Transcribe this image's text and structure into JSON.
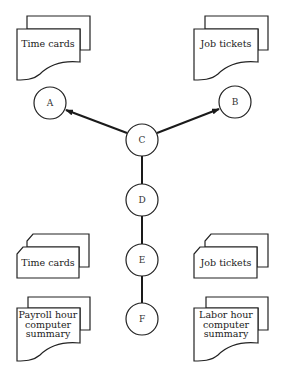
{
  "diagram": {
    "nodes": [
      {
        "id": "A",
        "label": "A"
      },
      {
        "id": "B",
        "label": "B"
      },
      {
        "id": "C",
        "label": "C"
      },
      {
        "id": "D",
        "label": "D"
      },
      {
        "id": "E",
        "label": "E"
      },
      {
        "id": "F",
        "label": "F"
      }
    ],
    "edges": [
      {
        "from": "C",
        "to": "A",
        "arrow": true
      },
      {
        "from": "C",
        "to": "B",
        "arrow": true
      },
      {
        "from": "C",
        "to": "D",
        "arrow": false
      },
      {
        "from": "D",
        "to": "E",
        "arrow": false
      },
      {
        "from": "E",
        "to": "F",
        "arrow": false
      }
    ],
    "documents": {
      "top_left": {
        "label": "Time cards"
      },
      "top_right": {
        "label": "Job tickets"
      },
      "bottom_left_summary": {
        "lines": [
          "Payroll hour",
          "computer",
          "summary"
        ]
      },
      "bottom_right_summary": {
        "lines": [
          "Labor hour",
          "computer",
          "summary"
        ]
      }
    },
    "cards": {
      "left": {
        "label": "Time cards"
      },
      "right": {
        "label": "Job tickets"
      }
    }
  }
}
